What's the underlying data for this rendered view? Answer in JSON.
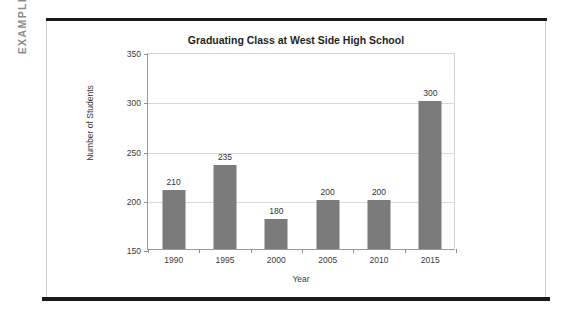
{
  "page": {
    "side_label": "EXAMPLE",
    "side_label_color": "#8d8d8d",
    "background": "#ffffff",
    "rule_color": "#1a1a1a",
    "box_border_color": "#cfcfcf"
  },
  "chart_data": {
    "type": "bar",
    "title": "Graduating Class at West Side High School",
    "xlabel": "Year",
    "ylabel": "Number of Students",
    "categories": [
      "1990",
      "1995",
      "2000",
      "2005",
      "2010",
      "2015"
    ],
    "values": [
      210,
      235,
      180,
      200,
      200,
      300
    ],
    "data_labels": [
      "210",
      "235",
      "180",
      "200",
      "200",
      "300"
    ],
    "ylim": [
      150,
      350
    ],
    "ytick_step": 50,
    "ytick_labels": [
      "150",
      "200",
      "250",
      "300",
      "350"
    ],
    "ytick_values": [
      150,
      200,
      250,
      300,
      350
    ],
    "grid": true,
    "grid_axis": "y",
    "grid_color": "#d8d8d8",
    "legend": false,
    "bar_color": "#7b7b7b",
    "axis_color": "#9a9a9a",
    "title_color": "#1f1f1f",
    "label_color": "#3a3a3a"
  }
}
